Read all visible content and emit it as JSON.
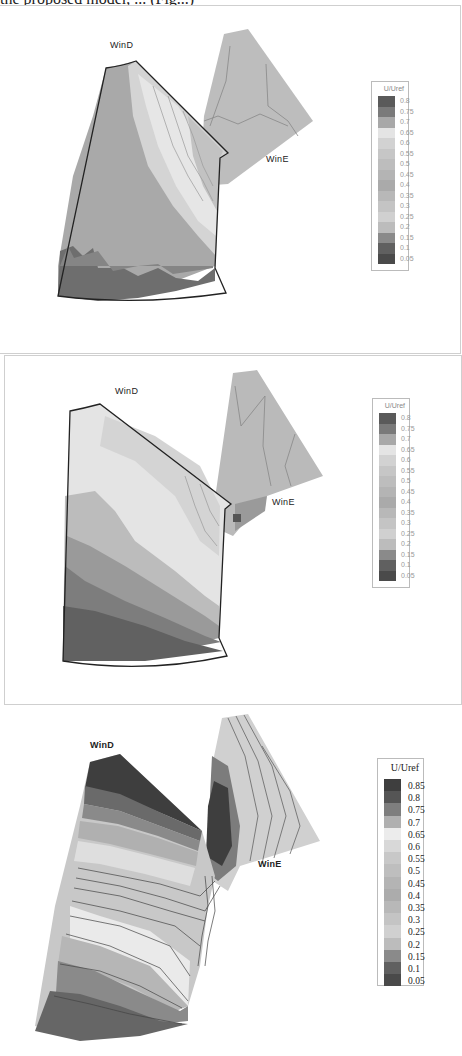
{
  "caption_fragment": "the proposed model, ... (Fig...)",
  "panels": [
    {
      "labels": {
        "inlet_d": "WinD",
        "inlet_e": "WinE"
      },
      "legend": {
        "title": "U/Uref",
        "values": [
          "0.8",
          "0.75",
          "0.7",
          "0.65",
          "0.6",
          "0.55",
          "0.5",
          "0.45",
          "0.4",
          "0.35",
          "0.3",
          "0.25",
          "0.2",
          "0.15",
          "0.1",
          "0.05"
        ]
      }
    },
    {
      "labels": {
        "inlet_d": "WinD",
        "inlet_e": "WinE"
      },
      "legend": {
        "title": "U/Uref",
        "values": [
          "0.8",
          "0.75",
          "0.7",
          "0.65",
          "0.6",
          "0.55",
          "0.5",
          "0.45",
          "0.4",
          "0.35",
          "0.3",
          "0.25",
          "0.2",
          "0.15",
          "0.1",
          "0.05"
        ]
      }
    },
    {
      "labels": {
        "inlet_d": "WinD",
        "inlet_e": "WinE"
      },
      "legend": {
        "title": "U/Uref",
        "values": [
          "0.85",
          "0.8",
          "0.75",
          "0.7",
          "0.65",
          "0.6",
          "0.55",
          "0.5",
          "0.45",
          "0.4",
          "0.35",
          "0.3",
          "0.25",
          "0.2",
          "0.15",
          "0.1",
          "0.05"
        ]
      }
    }
  ],
  "colors": {
    "legend_swatches_16": [
      "#5a5a5a",
      "#7a7a7a",
      "#a8a8a8",
      "#e4e4e4",
      "#d2d2d2",
      "#c6c6c6",
      "#bdbdbd",
      "#b4b4b4",
      "#aaaaaa",
      "#b8b8b8",
      "#c4c4c4",
      "#d0d0d0",
      "#bcbcbc",
      "#8a8a8a",
      "#606060",
      "#4a4a4a"
    ],
    "legend_swatches_17": [
      "#3e3e3e",
      "#555555",
      "#7e7e7e",
      "#b0b0b0",
      "#ececec",
      "#d8d8d8",
      "#c8c8c8",
      "#bebebe",
      "#b4b4b4",
      "#acacac",
      "#b8b8b8",
      "#c4c4c4",
      "#d0d0d0",
      "#bcbcbc",
      "#8a8a8a",
      "#606060",
      "#4a4a4a"
    ]
  }
}
